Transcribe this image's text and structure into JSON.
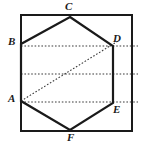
{
  "figure": {
    "type": "geometry-diagram",
    "colors": {
      "background": "#ffffff",
      "stroke": "#1a1a1a",
      "square_stroke": "#1a1a1a",
      "hexagon_stroke": "#1a1a1a",
      "dotted_stroke": "#3a3a3a",
      "label_color": "#1a1a1a"
    },
    "square": {
      "name": "bounding-square",
      "left": 21,
      "top": 15,
      "right": 132,
      "bottom": 131,
      "stroke_width": 2.2
    },
    "hexagon": {
      "name": "hexagon-abcdef",
      "stroke_width": 2.2,
      "points": "70,17 113,46 113,103 70,130 21,101 21,44"
    },
    "vertices": [
      {
        "id": "A",
        "label": "A",
        "x": 21,
        "y": 101,
        "label_x": 8,
        "label_y": 93
      },
      {
        "id": "B",
        "label": "B",
        "x": 21,
        "y": 44,
        "label_x": 8,
        "label_y": 36
      },
      {
        "id": "C",
        "label": "C",
        "x": 70,
        "y": 17,
        "label_x": 65,
        "label_y": 1
      },
      {
        "id": "D",
        "label": "D",
        "x": 113,
        "y": 46,
        "label_x": 113,
        "label_y": 33
      },
      {
        "id": "E",
        "label": "E",
        "x": 113,
        "y": 103,
        "label_x": 113,
        "label_y": 104
      },
      {
        "id": "F",
        "label": "F",
        "x": 70,
        "y": 130,
        "label_x": 67,
        "label_y": 132
      }
    ],
    "dotted_lines": [
      {
        "name": "dotted-line-bd",
        "x1": 21,
        "y1": 46,
        "x2": 138,
        "y2": 46
      },
      {
        "name": "dotted-line-midline",
        "x1": 21,
        "y1": 74,
        "x2": 138,
        "y2": 74
      },
      {
        "name": "dotted-line-ae",
        "x1": 21,
        "y1": 102,
        "x2": 138,
        "y2": 102
      },
      {
        "name": "dotted-diagonal-ad",
        "x1": 21,
        "y1": 101,
        "x2": 118,
        "y2": 41
      }
    ],
    "dotted_stroke_width": 1.1,
    "dash_pattern": "1.6 1.8"
  }
}
